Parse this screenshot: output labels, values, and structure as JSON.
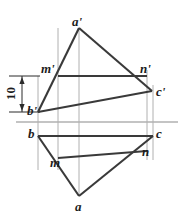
{
  "figure": {
    "width": 187,
    "height": 219,
    "background": "#ffffff",
    "colors": {
      "object_line": "#3a3a3a",
      "projection_line": "#b0b0b0",
      "ground_line": "#b0b0b0",
      "dimension_line": "#2b2b2b",
      "text": "#1c1c1c"
    }
  },
  "dimension": {
    "value": "10",
    "orientation": "vertical",
    "from_label": "m'",
    "to_label": "b'"
  },
  "labels": [
    {
      "id": "a-prime",
      "text": "a'",
      "x": 72,
      "y": 15
    },
    {
      "id": "m-prime",
      "text": "m'",
      "x": 41,
      "y": 62
    },
    {
      "id": "n-prime",
      "text": "n'",
      "x": 140,
      "y": 62
    },
    {
      "id": "c-prime",
      "text": "c'",
      "x": 156,
      "y": 85
    },
    {
      "id": "b-prime",
      "text": "b'",
      "x": 27,
      "y": 104
    },
    {
      "id": "b",
      "text": "b",
      "x": 28,
      "y": 127
    },
    {
      "id": "c",
      "text": "c",
      "x": 156,
      "y": 127
    },
    {
      "id": "n",
      "text": "n",
      "x": 142,
      "y": 145
    },
    {
      "id": "m",
      "text": "m",
      "x": 50,
      "y": 156
    },
    {
      "id": "a",
      "text": "a",
      "x": 75,
      "y": 200
    }
  ],
  "points": {
    "a_prime": {
      "x": 79,
      "y": 28
    },
    "m_prime": {
      "x": 58,
      "y": 76
    },
    "n_prime": {
      "x": 147,
      "y": 76
    },
    "c_prime": {
      "x": 152,
      "y": 91
    },
    "b_prime": {
      "x": 38,
      "y": 112
    },
    "b": {
      "x": 38,
      "y": 136
    },
    "c": {
      "x": 153,
      "y": 136
    },
    "n": {
      "x": 147,
      "y": 151
    },
    "m": {
      "x": 58,
      "y": 158
    },
    "a": {
      "x": 79,
      "y": 196
    }
  },
  "ground_line": {
    "x1": 16,
    "y1": 122,
    "x2": 178,
    "y2": 122
  }
}
